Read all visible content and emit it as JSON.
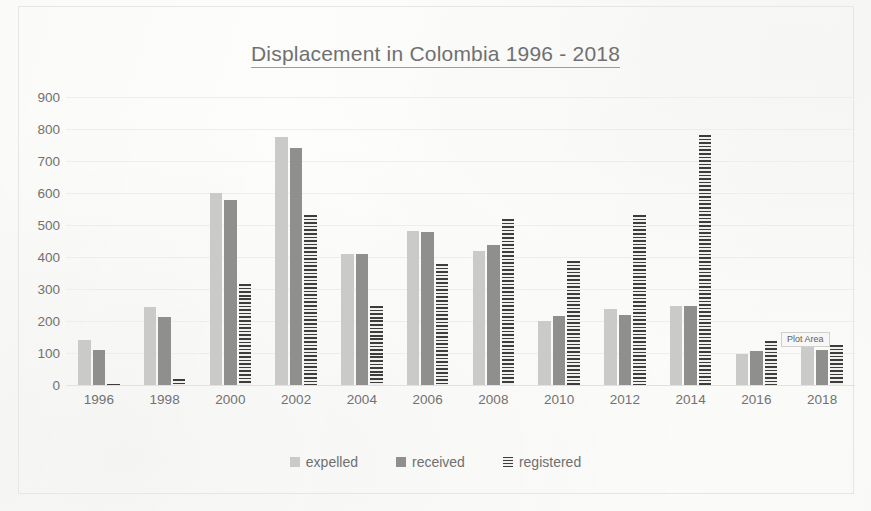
{
  "chart_data": {
    "type": "bar",
    "title": "Displacement in Colombia 1996 - 2018",
    "xlabel": "",
    "ylabel": "",
    "ylim": [
      0,
      900
    ],
    "ytick_step": 100,
    "yticks": [
      900,
      800,
      700,
      600,
      500,
      400,
      300,
      200,
      100,
      0
    ],
    "grid": true,
    "legend_position": "bottom",
    "categories": [
      "1996",
      "1998",
      "2000",
      "2002",
      "2004",
      "2006",
      "2008",
      "2010",
      "2012",
      "2014",
      "2016",
      "2018"
    ],
    "series": [
      {
        "name": "expelled",
        "color": "#c9c9c7",
        "pattern": "solid",
        "values": [
          140,
          245,
          600,
          775,
          410,
          480,
          420,
          200,
          238,
          248,
          98,
          120
        ]
      },
      {
        "name": "received",
        "color": "#8d8d8b",
        "pattern": "solid",
        "values": [
          110,
          212,
          578,
          742,
          408,
          478,
          437,
          215,
          220,
          248,
          105,
          110
        ]
      },
      {
        "name": "registered",
        "color": "#3a3a3a",
        "pattern": "horizontal-stripes",
        "values": [
          3,
          18,
          315,
          530,
          248,
          378,
          520,
          387,
          530,
          780,
          138,
          125
        ]
      }
    ]
  },
  "annotations": {
    "plot_area_tooltip": "Plot Area"
  },
  "colors": {
    "expelled": "#c9c9c7",
    "received": "#8d8d8b",
    "registered": "#3a3a3a",
    "gridline": "#eceded",
    "text": "#6f6f6f",
    "background": "#fdfdfc"
  }
}
